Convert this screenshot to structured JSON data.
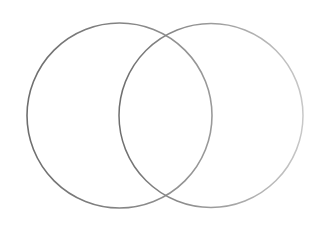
{
  "diagram": {
    "type": "venn",
    "sets": [
      {
        "name": "left-circle",
        "cx": 119.5,
        "cy": 115.5,
        "r": 92.5,
        "stroke": "#7a7a7a"
      },
      {
        "name": "right-circle",
        "cx": 211,
        "cy": 115.5,
        "r": 92,
        "stroke": "#8a8a8a"
      }
    ],
    "background": "#ffffff",
    "labels": []
  }
}
